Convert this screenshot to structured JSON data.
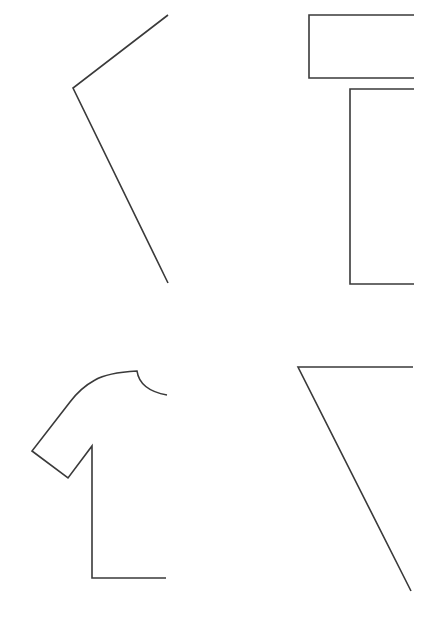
{
  "canvas": {
    "width": 442,
    "height": 623,
    "background": "#ffffff",
    "stroke_color": "#3a3a3a"
  },
  "figures": [
    {
      "name": "half-angle-shape",
      "position": "top-left",
      "points": "168,15 73,88 168,283"
    },
    {
      "name": "half-rectangle-shapes",
      "position": "top-right",
      "top_box": "414,15 309,15 309,78 414,78",
      "bottom_box": "414,89 350,89 350,284 414,284"
    },
    {
      "name": "half-tshirt-shape",
      "position": "bottom-left",
      "path": "M167,395 C150,392 139,385 137,371 C120,372 105,374 95,380 C84,386 76,394 70,402 L32,451 L68,478 L92,446 L92,578 L166,578"
    },
    {
      "name": "half-triangle-shape",
      "position": "bottom-right",
      "points": "413,367 298,367 411,591"
    }
  ]
}
